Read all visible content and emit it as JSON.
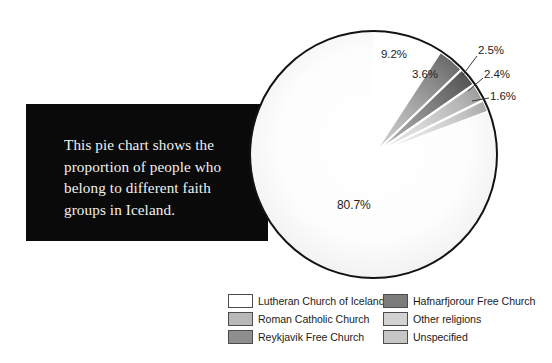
{
  "caption": {
    "text": "This pie chart shows the\nproportion of people who\nbelong to different faith\ngroups in Iceland."
  },
  "chart_data": {
    "type": "pie",
    "title": "",
    "subtitle": "",
    "xlabel": "",
    "ylabel": "",
    "legend_position": "bottom",
    "grid": false,
    "unit": "%",
    "start_angle_deg": 0,
    "direction": "clockwise",
    "categories": [
      "Lutheran Church of Iceland",
      "Roman Catholic Church",
      "Reykjavik Free Church",
      "Hafnarfjorour Free Church",
      "Other religions",
      "Unspecified"
    ],
    "values": [
      80.7,
      9.2,
      3.6,
      2.5,
      2.4,
      1.6
    ],
    "value_labels": [
      "80.7%",
      "9.2%",
      "3.6%",
      "2.5%",
      "2.4%",
      "1.6%"
    ],
    "colors": [
      "#fdfdfd",
      "#b4b4b4",
      "#8d8d8d",
      "#6e6e6e",
      "#c9c9c9",
      "#d8d8d8"
    ],
    "slices": [
      {
        "label": "Lutheran Church of Iceland",
        "value": 80.7,
        "value_label": "80.7%",
        "color": "#fdfdfd"
      },
      {
        "label": "Roman Catholic Church",
        "value": 9.2,
        "value_label": "9.2%",
        "color": "#b4b4b4"
      },
      {
        "label": "Reykjavik Free Church",
        "value": 3.6,
        "value_label": "3.6%",
        "color": "#8d8d8d"
      },
      {
        "label": "Hafnarfjorour Free Church",
        "value": 2.5,
        "value_label": "2.5%",
        "color": "#6e6e6e"
      },
      {
        "label": "Other religions",
        "value": 2.4,
        "value_label": "2.4%",
        "color": "#c9c9c9"
      },
      {
        "label": "Unspecified",
        "value": 1.6,
        "value_label": "1.6%",
        "color": "#d8d8d8"
      }
    ]
  },
  "legend": {
    "items": [
      {
        "label": "Lutheran Church of Iceland",
        "color": "#ffffff"
      },
      {
        "label": "Hafnarfjorour Free Church",
        "color": "#7c7c7c"
      },
      {
        "label": "Roman Catholic Church",
        "color": "#b8b8b8"
      },
      {
        "label": "Other religions",
        "color": "#d2d2d2"
      },
      {
        "label": "Reykjavik Free Church",
        "color": "#8e8e8e"
      },
      {
        "label": "Unspecified",
        "color": "#c6c6c6"
      }
    ]
  }
}
